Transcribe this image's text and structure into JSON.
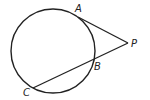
{
  "diagram": {
    "type": "geometry",
    "circle": {
      "cx": 53,
      "cy": 51,
      "r": 42
    },
    "points": {
      "A": {
        "label": "A",
        "x": 78,
        "y": 17
      },
      "B": {
        "label": "B",
        "x": 93,
        "y": 60
      },
      "C": {
        "label": "C",
        "x": 33,
        "y": 88
      },
      "P": {
        "label": "P",
        "x": 128,
        "y": 43
      }
    },
    "segments": [
      {
        "name": "tangent-PA",
        "from": "P",
        "to": "A"
      },
      {
        "name": "secant-PC",
        "from": "P",
        "to": "C"
      }
    ],
    "stroke_color": "#222222"
  }
}
